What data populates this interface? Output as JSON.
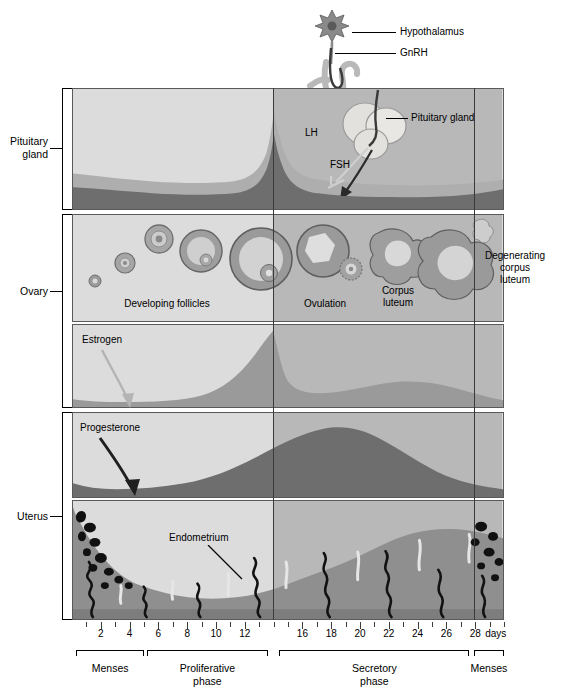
{
  "brackets": [
    {
      "id": "pituitary",
      "label": "Pituitary\ngland"
    },
    {
      "id": "ovary",
      "label": "Ovary"
    },
    {
      "id": "uterus",
      "label": "Uterus"
    }
  ],
  "callouts": {
    "hypothalamus": "Hypothalamus",
    "gnrh": "GnRH",
    "pituitary_gland": "Pituitary gland",
    "lh": "LH",
    "fsh": "FSH",
    "estrogen": "Estrogen",
    "progesterone": "Progesterone",
    "endometrium": "Endometrium"
  },
  "ovary_labels": {
    "developing_follicles": "Developing follicles",
    "ovulation": "Ovulation",
    "corpus_luteum": "Corpus\nluteum",
    "degenerating_corpus_luteum": "Degenerating\ncorpus\nluteum"
  },
  "axis": {
    "unit_label": "days",
    "day_ticks": [
      1,
      2,
      3,
      4,
      5,
      6,
      7,
      8,
      9,
      10,
      11,
      12,
      13,
      14,
      15,
      16,
      17,
      18,
      19,
      20,
      21,
      22,
      23,
      24,
      25,
      26,
      27,
      28,
      29,
      30
    ],
    "labeled_days": [
      2,
      4,
      6,
      8,
      10,
      12,
      16,
      18,
      20,
      22,
      24,
      26,
      28
    ],
    "range_start": 0,
    "range_end": 30
  },
  "phases": [
    {
      "name": "Menses",
      "start_day": 0.3,
      "end_day": 5.0,
      "label": "Menses"
    },
    {
      "name": "Proliferative",
      "start_day": 5.2,
      "end_day": 13.6,
      "label": "Proliferative\nphase"
    },
    {
      "name": "Secretory",
      "start_day": 14.4,
      "end_day": 27.6,
      "label": "Secretory\nphase"
    },
    {
      "name": "Menses2",
      "start_day": 27.9,
      "end_day": 30.0,
      "label": "Menses"
    }
  ],
  "dividers": {
    "ovulation_day": 14,
    "cycle_end_day": 28
  },
  "palette": {
    "panel_light": "#dcdcdc",
    "panel_shade": "#b8b8b8",
    "curve_light": "#aeaeae",
    "curve_mid": "#9a9a9a",
    "curve_dark": "#6e6e6e",
    "curve_darkest": "#5e5e5e",
    "endometrium_tissue": "#8f8f8f",
    "endometrium_lumen": "#dcdcdc",
    "blood": "#111111",
    "outline": "#58595b",
    "text": "#000000"
  },
  "chart_data": [
    {
      "type": "area",
      "id": "pituitary-hormones",
      "title": "Pituitary gonadotropins",
      "xlabel": "Cycle day",
      "ylabel": "Relative concentration",
      "xlim": [
        0,
        30
      ],
      "ylim": [
        0,
        100
      ],
      "grid": false,
      "legend": [
        "LH",
        "FSH"
      ],
      "x": [
        0,
        2,
        4,
        6,
        8,
        10,
        12,
        13,
        14,
        15,
        16,
        18,
        20,
        22,
        24,
        26,
        28,
        30
      ],
      "series": [
        {
          "name": "LH",
          "values": [
            30,
            28,
            26,
            25,
            24,
            24,
            30,
            60,
            95,
            62,
            30,
            24,
            22,
            21,
            20,
            20,
            22,
            30
          ]
        },
        {
          "name": "FSH",
          "values": [
            22,
            21,
            19,
            17,
            16,
            15,
            16,
            30,
            62,
            32,
            17,
            14,
            13,
            13,
            13,
            14,
            18,
            24
          ]
        }
      ]
    },
    {
      "type": "area",
      "id": "estrogen",
      "title": "Estrogen",
      "xlabel": "Cycle day",
      "ylabel": "Relative concentration",
      "xlim": [
        0,
        30
      ],
      "ylim": [
        0,
        100
      ],
      "grid": false,
      "x": [
        0,
        2,
        4,
        6,
        8,
        10,
        11,
        12,
        13,
        14,
        15,
        16,
        18,
        20,
        22,
        24,
        26,
        28,
        30
      ],
      "values": [
        12,
        9,
        8,
        9,
        14,
        30,
        45,
        62,
        80,
        88,
        52,
        38,
        40,
        48,
        52,
        48,
        34,
        16,
        12
      ]
    },
    {
      "type": "area",
      "id": "progesterone",
      "title": "Progesterone",
      "xlabel": "Cycle day",
      "ylabel": "Relative concentration",
      "xlim": [
        0,
        30
      ],
      "ylim": [
        0,
        100
      ],
      "grid": false,
      "x": [
        0,
        2,
        4,
        6,
        8,
        10,
        12,
        14,
        16,
        18,
        20,
        21,
        22,
        24,
        26,
        28,
        30
      ],
      "values": [
        16,
        10,
        9,
        10,
        12,
        16,
        22,
        34,
        58,
        78,
        88,
        90,
        86,
        66,
        42,
        26,
        18
      ]
    },
    {
      "type": "area",
      "id": "endometrium-thickness",
      "title": "Endometrial thickness",
      "xlabel": "Cycle day",
      "ylabel": "Relative thickness",
      "xlim": [
        0,
        30
      ],
      "ylim": [
        0,
        100
      ],
      "grid": false,
      "x": [
        0,
        1,
        2,
        3,
        4,
        5,
        6,
        8,
        10,
        12,
        14,
        16,
        18,
        20,
        22,
        24,
        26,
        27,
        28,
        29,
        30
      ],
      "values": [
        78,
        60,
        40,
        28,
        22,
        22,
        26,
        32,
        40,
        48,
        56,
        62,
        68,
        74,
        78,
        82,
        84,
        84,
        80,
        60,
        50
      ]
    }
  ]
}
